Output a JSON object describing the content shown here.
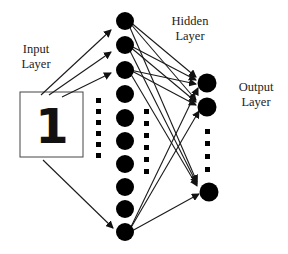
{
  "labels": {
    "input_line1": "Input",
    "input_line2": "Layer",
    "hidden_line1": "Hidden",
    "hidden_line2": "Layer",
    "output_line1": "Output",
    "output_line2": "Layer"
  },
  "input": {
    "digit": "1"
  },
  "colors": {
    "node": "#000000",
    "edge": "#1a1a1a",
    "text": "#222222",
    "background": "#ffffff"
  },
  "hidden_nodes": {
    "count": 10
  },
  "output_nodes": {
    "count": 3
  }
}
